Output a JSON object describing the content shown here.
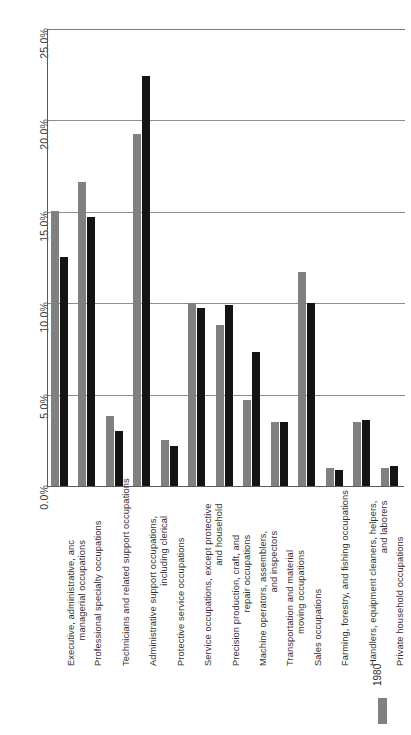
{
  "chart_data": {
    "type": "bar",
    "title": "",
    "xlabel": "",
    "ylabel": "",
    "ylim": [
      0,
      25
    ],
    "grid": true,
    "legend_position": "bottom-right",
    "orientation": "vertical",
    "ytick_labels": [
      "25.0%",
      "20.0%",
      "15.0%",
      "10.0%",
      "5.0%",
      "0.0%"
    ],
    "ytick_values": [
      25.0,
      20.0,
      15.0,
      10.0,
      5.0,
      0.0
    ],
    "categories": [
      "Executive, administrative, anc managerial occupations",
      "Professional specialty occupations",
      "Technicians and related support occupations",
      "Administrative support occupations, including clerical",
      "Protective service occupations",
      "Service occupations, except protective and household",
      "Precision production, craft, and repair occupations",
      "Machine operators, assemblers, and inspectors",
      "Transportation and material moving occupations",
      "Sales occupations",
      "Farming, forestry, and fishing occupations",
      "Handlers, equipment cleaners, helpers, and laborers",
      "Private household occupations"
    ],
    "category_lines": [
      [
        "Executive, administrative, anc",
        "managerial occupations"
      ],
      [
        "Professional specialty occupations"
      ],
      [
        "Technicians and related support occupations"
      ],
      [
        "Administrative support occupations,",
        "including clerical"
      ],
      [
        "Protective service occupations"
      ],
      [
        "Service occupations, except protective",
        "and household"
      ],
      [
        "Precision production, craft, and",
        "repair occupations"
      ],
      [
        "Machine operators, assemblers,",
        "and inspectors"
      ],
      [
        "Transportation and material",
        "moving occupations"
      ],
      [
        "Sales occupations"
      ],
      [
        "Farming, forestry, and fishing occupations"
      ],
      [
        "Handlers, equipment cleaners, helpers,",
        "and laborers"
      ],
      [
        "Private household occupations"
      ]
    ],
    "series": [
      {
        "name": "1980",
        "color": "#808080",
        "values": [
          15.0,
          16.6,
          3.8,
          19.2,
          2.5,
          10.0,
          8.8,
          4.7,
          3.5,
          11.7,
          1.0,
          3.5,
          1.0
        ]
      },
      {
        "name": "1990",
        "color": "#141414",
        "values": [
          12.5,
          14.7,
          3.0,
          22.4,
          2.2,
          9.7,
          9.9,
          7.3,
          3.5,
          10.0,
          0.9,
          3.6,
          1.1
        ]
      }
    ],
    "legend": [
      {
        "label": "1980",
        "color": "#808080"
      }
    ]
  }
}
